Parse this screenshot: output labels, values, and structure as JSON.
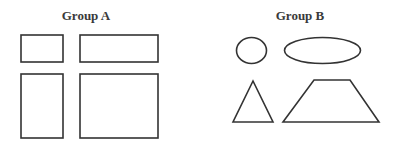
{
  "groups": [
    {
      "title": "Group A",
      "shapes": [
        {
          "type": "rectangle",
          "label": "small-rectangle"
        },
        {
          "type": "rectangle",
          "label": "wide-rectangle"
        },
        {
          "type": "rectangle",
          "label": "tall-rectangle"
        },
        {
          "type": "rectangle",
          "label": "large-rectangle"
        }
      ]
    },
    {
      "title": "Group B",
      "shapes": [
        {
          "type": "circle",
          "label": "circle"
        },
        {
          "type": "ellipse",
          "label": "ellipse"
        },
        {
          "type": "triangle",
          "label": "triangle"
        },
        {
          "type": "trapezoid",
          "label": "trapezoid"
        }
      ]
    }
  ],
  "colors": {
    "stroke": "#333333",
    "title": "#3a3a3a",
    "background": "#ffffff"
  }
}
